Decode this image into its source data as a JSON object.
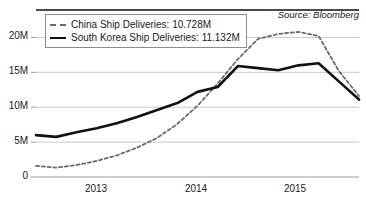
{
  "source_note": "Source: Bloomberg",
  "legend": {
    "position": "top-left",
    "entries": [
      {
        "label": "China Ship Deliveries: 10.728M",
        "style": "dashed",
        "color": "#6b6b6b"
      },
      {
        "label": "South Korea Ship Deliveries: 11.132M",
        "style": "solid",
        "color": "#111111"
      }
    ]
  },
  "axes": {
    "y_ticks": [
      "0",
      "5M",
      "10M",
      "15M",
      "20M"
    ],
    "x_ticks": [
      "2013",
      "2014",
      "2015"
    ]
  },
  "chart_data": {
    "type": "line",
    "title": "",
    "xlabel": "",
    "ylabel": "",
    "grid": true,
    "legend_position": "top-left",
    "ylim": [
      0,
      22.5
    ],
    "ytick_values": [
      0,
      5,
      10,
      15,
      20
    ],
    "ytick_labels": [
      "0",
      "5M",
      "10M",
      "15M",
      "20M"
    ],
    "xtick_labels": [
      "2013",
      "2014",
      "2015"
    ],
    "xtick_x": [
      96,
      196,
      295
    ],
    "x": [
      0,
      1,
      2,
      3,
      4,
      5,
      6,
      7,
      8,
      9,
      10,
      11,
      12,
      13,
      14,
      15,
      16
    ],
    "series": [
      {
        "name": "China Ship Deliveries",
        "style": "dashed",
        "color": "#6b6b6b",
        "latest_value": 10.728,
        "latest_label": "10.728M",
        "values": [
          1.6,
          1.35,
          1.7,
          2.3,
          3.1,
          4.2,
          5.6,
          7.6,
          10.2,
          13.4,
          16.9,
          19.8,
          20.5,
          20.8,
          20.2,
          15.2,
          11.6
        ]
      },
      {
        "name": "South Korea Ship Deliveries",
        "style": "solid",
        "color": "#111111",
        "latest_value": 11.132,
        "latest_label": "11.132M",
        "values": [
          6.0,
          5.75,
          6.4,
          7.0,
          7.7,
          8.6,
          9.6,
          10.6,
          12.2,
          12.9,
          15.9,
          15.6,
          15.3,
          16.0,
          16.3,
          13.7,
          11.1
        ]
      }
    ]
  }
}
